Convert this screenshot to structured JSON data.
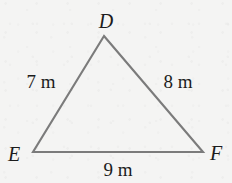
{
  "figure": {
    "type": "triangle-diagram",
    "background_color": "#f4f4f3",
    "stroke_color": "#7b7b7b",
    "text_color": "#1c1c1c",
    "canvas": {
      "width": 232,
      "height": 183
    },
    "vertices": [
      {
        "id": "D",
        "label": "D",
        "x": 104,
        "y": 36
      },
      {
        "id": "E",
        "label": "E",
        "x": 33,
        "y": 152
      },
      {
        "id": "F",
        "label": "F",
        "x": 203,
        "y": 152
      }
    ],
    "sides": [
      {
        "id": "DE",
        "from": "D",
        "to": "E",
        "label": "7 m",
        "length": 7,
        "unit": "m"
      },
      {
        "id": "DF",
        "from": "D",
        "to": "F",
        "label": "8 m",
        "length": 8,
        "unit": "m"
      },
      {
        "id": "EF",
        "from": "E",
        "to": "F",
        "label": "9 m",
        "length": 9,
        "unit": "m"
      }
    ],
    "polygon_points": "104,36 203,152 33,152"
  }
}
